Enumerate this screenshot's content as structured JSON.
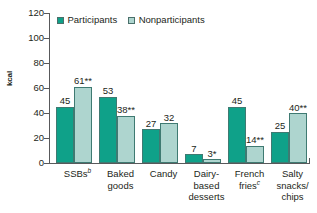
{
  "chart_data": {
    "type": "bar",
    "title": "",
    "subtitle": "",
    "xlabel": "",
    "ylabel": "kcal",
    "ylim": [
      0,
      120
    ],
    "yticks": [
      0,
      20,
      40,
      60,
      80,
      100,
      120
    ],
    "ytick_labels": [
      "0",
      "20",
      "40",
      "60",
      "80",
      "100",
      "120"
    ],
    "grid": false,
    "legend_position": "top-left",
    "categories": [
      "SSBs",
      "Baked goods",
      "Candy",
      "Dairy-based desserts",
      "French fries",
      "Salty snacks/chips"
    ],
    "series": [
      {
        "name": "Participants",
        "color": "#0fa189",
        "values": [
          45,
          53,
          27,
          7,
          45,
          25
        ],
        "labels": [
          "45",
          "53",
          "27",
          "7",
          "45",
          "25"
        ]
      },
      {
        "name": "Nonparticipants",
        "color": "#aed5cf",
        "values": [
          61,
          38,
          32,
          3,
          14,
          40
        ],
        "labels": [
          "61**",
          "38**",
          "32",
          "3*",
          "14**",
          "40**"
        ]
      }
    ],
    "annotations": {
      "significance_markers": [
        "**",
        "*"
      ],
      "category_footnotes": {
        "SSBs": "b",
        "French fries": "c"
      }
    }
  },
  "axis": {
    "ylabel": "kcal",
    "ticks": [
      {
        "value": 120,
        "label": "120"
      },
      {
        "value": 100,
        "label": "100"
      },
      {
        "value": 80,
        "label": "80"
      },
      {
        "value": 60,
        "label": "60"
      },
      {
        "value": 40,
        "label": "40"
      },
      {
        "value": 20,
        "label": "20"
      },
      {
        "value": 0,
        "label": "0"
      }
    ]
  },
  "legend": {
    "items": [
      {
        "label": "Participants",
        "color": "#0fa189"
      },
      {
        "label": "Nonparticipants",
        "color": "#aed5cf"
      }
    ]
  },
  "categories": [
    {
      "line1": "SSBs",
      "sup": "b",
      "line2": "",
      "line3": ""
    },
    {
      "line1": "Baked",
      "sup": "",
      "line2": "goods",
      "line3": ""
    },
    {
      "line1": "Candy",
      "sup": "",
      "line2": "",
      "line3": ""
    },
    {
      "line1": "Dairy-",
      "sup": "",
      "line2": "based",
      "line3": "desserts"
    },
    {
      "line1": "French",
      "sup": "",
      "line2": "fries",
      "line3": "",
      "sup2": "c"
    },
    {
      "line1": "Salty",
      "sup": "",
      "line2": "snacks/",
      "line3": "chips"
    }
  ],
  "bars": [
    {
      "group": 0,
      "series": "Participants",
      "value": 45,
      "label": "45"
    },
    {
      "group": 0,
      "series": "Nonparticipants",
      "value": 61,
      "label": "61**"
    },
    {
      "group": 1,
      "series": "Participants",
      "value": 53,
      "label": "53"
    },
    {
      "group": 1,
      "series": "Nonparticipants",
      "value": 38,
      "label": "38**"
    },
    {
      "group": 2,
      "series": "Participants",
      "value": 27,
      "label": "27"
    },
    {
      "group": 2,
      "series": "Nonparticipants",
      "value": 32,
      "label": "32"
    },
    {
      "group": 3,
      "series": "Participants",
      "value": 7,
      "label": "7"
    },
    {
      "group": 3,
      "series": "Nonparticipants",
      "value": 3,
      "label": "3*"
    },
    {
      "group": 4,
      "series": "Participants",
      "value": 45,
      "label": "45"
    },
    {
      "group": 4,
      "series": "Nonparticipants",
      "value": 14,
      "label": "14**"
    },
    {
      "group": 5,
      "series": "Participants",
      "value": 25,
      "label": "25"
    },
    {
      "group": 5,
      "series": "Nonparticipants",
      "value": 40,
      "label": "40**"
    }
  ]
}
